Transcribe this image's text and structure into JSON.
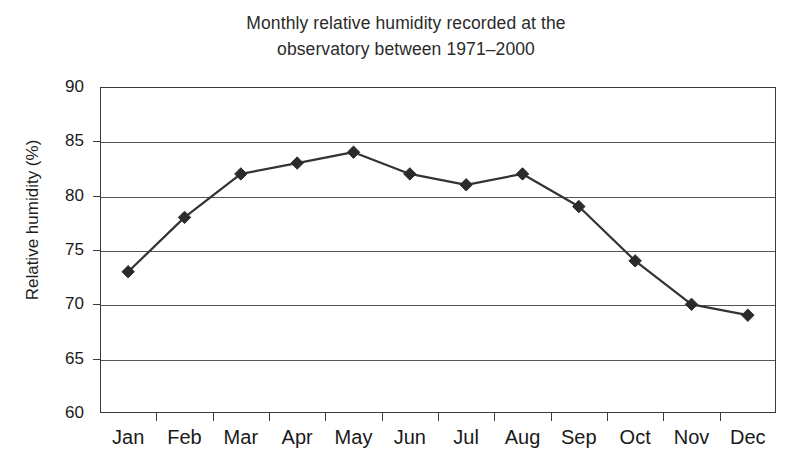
{
  "chart_data": {
    "type": "line",
    "title": "Monthly relative humidity recorded at the observatory between 1971–2000",
    "title_line1": "Monthly relative humidity recorded at the",
    "title_line2": "observatory between 1971–2000",
    "xlabel": "",
    "ylabel": "Relative humidity (%)",
    "categories": [
      "Jan",
      "Feb",
      "Mar",
      "Apr",
      "May",
      "Jun",
      "Jul",
      "Aug",
      "Sep",
      "Oct",
      "Nov",
      "Dec"
    ],
    "values": [
      73,
      78,
      82,
      83,
      84,
      82,
      81,
      82,
      79,
      74,
      70,
      69
    ],
    "series": [
      {
        "name": "Relative humidity (%)",
        "values": [
          73,
          78,
          82,
          83,
          84,
          82,
          81,
          82,
          79,
          74,
          70,
          69
        ]
      }
    ],
    "ylim": [
      60,
      90
    ],
    "yticks": [
      90,
      85,
      80,
      75,
      70,
      65,
      60
    ],
    "ytick_labels": [
      "90",
      "85",
      "80",
      "75",
      "70",
      "65",
      "60"
    ],
    "grid": true,
    "grid_axis": "y",
    "legend": false,
    "legend_position": "none",
    "marker": "diamond",
    "marker_color": "#2b2b2b",
    "line_color": "#333333",
    "axis_color": "#3a3a3a",
    "grid_color": "#555555",
    "background": "#ffffff"
  }
}
